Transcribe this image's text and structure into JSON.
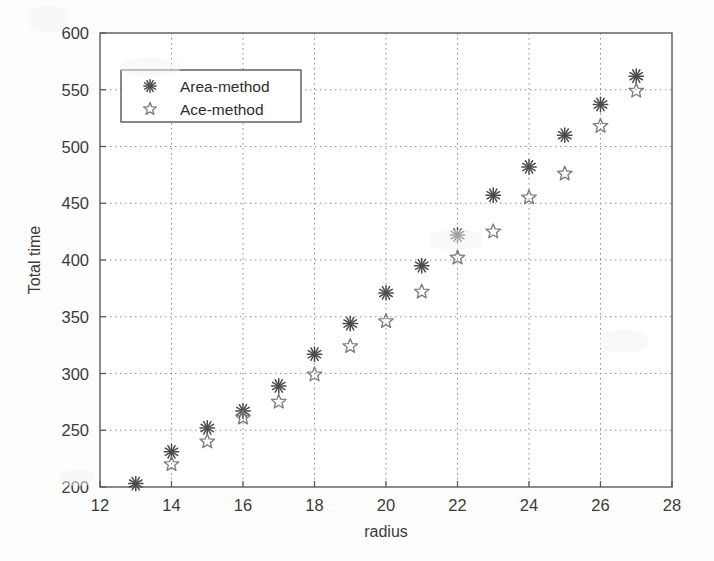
{
  "chart_data": {
    "type": "scatter",
    "title": "",
    "xlabel": "radius",
    "ylabel": "Total time",
    "xlim": [
      12,
      28
    ],
    "ylim": [
      200,
      600
    ],
    "xticks": [
      12,
      14,
      16,
      18,
      20,
      22,
      24,
      26,
      28
    ],
    "yticks": [
      200,
      250,
      300,
      350,
      400,
      450,
      500,
      550,
      600
    ],
    "grid": true,
    "legend_position": "upper left",
    "x": [
      13,
      14,
      15,
      16,
      17,
      18,
      19,
      20,
      21,
      22,
      23,
      24,
      25,
      26,
      27
    ],
    "series": [
      {
        "name": "Area-method",
        "marker": "asterisk",
        "color": "#4b4b4b",
        "x": [
          13,
          14,
          15,
          16,
          17,
          18,
          19,
          20,
          21,
          22,
          23,
          24,
          25,
          26,
          27
        ],
        "values": [
          203,
          231,
          252,
          267,
          289,
          317,
          344,
          371,
          395,
          422,
          457,
          482,
          510,
          537,
          562
        ]
      },
      {
        "name": "Ace-method",
        "marker": "open-star",
        "color": "#7d7d7d",
        "x": [
          14,
          15,
          16,
          17,
          18,
          19,
          20,
          21,
          22,
          23,
          24,
          25,
          26,
          27
        ],
        "values": [
          220,
          240,
          261,
          275,
          299,
          324,
          346,
          372,
          402,
          425,
          455,
          476,
          518,
          549
        ]
      }
    ]
  },
  "axes": {
    "xlabel": "radius",
    "ylabel": "Total time",
    "xtick_labels": [
      "12",
      "14",
      "16",
      "18",
      "20",
      "22",
      "24",
      "26",
      "28"
    ],
    "ytick_labels": [
      "200",
      "250",
      "300",
      "350",
      "400",
      "450",
      "500",
      "550",
      "600"
    ]
  },
  "legend": {
    "entries": [
      {
        "label": "Area-method",
        "marker": "asterisk"
      },
      {
        "label": "Ace-method",
        "marker": "open-star"
      }
    ]
  }
}
